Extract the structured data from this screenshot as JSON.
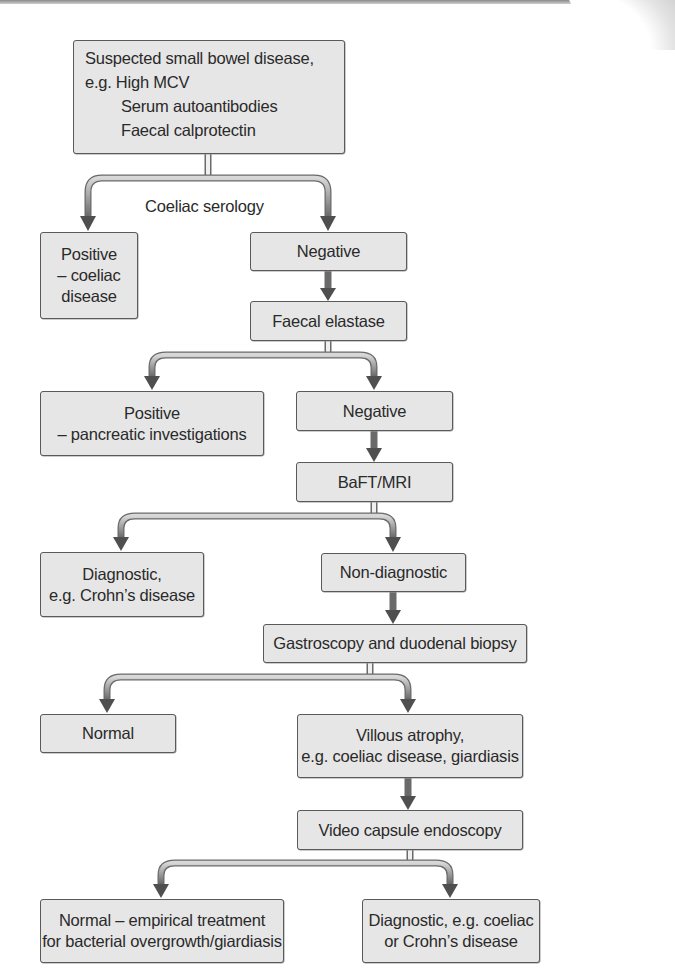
{
  "diagram": {
    "type": "flowchart",
    "colors": {
      "box_fill": "#e6e6e6",
      "box_border": "#5a5a5a",
      "connector": "#8c8c8c",
      "arrowhead": "#555555",
      "text": "#2a2a2a"
    },
    "start": {
      "title": "Suspected small bowel disease,",
      "prefix": "e.g.",
      "examples": [
        "High MCV",
        "Serum autoantibodies",
        "Faecal calprotectin"
      ]
    },
    "edge_labels": {
      "coeliac_serology": "Coeliac serology"
    },
    "nodes": {
      "positive_coeliac": [
        "Positive",
        "– coeliac",
        "disease"
      ],
      "negative_1": [
        "Negative"
      ],
      "faecal_elastase": [
        "Faecal elastase"
      ],
      "positive_pancreatic": [
        "Positive",
        "– pancreatic investigations"
      ],
      "negative_2": [
        "Negative"
      ],
      "baft_mri": [
        "BaFT/MRI"
      ],
      "diagnostic_crohns": [
        "Diagnostic,",
        "e.g. Crohn’s disease"
      ],
      "non_diagnostic": [
        "Non-diagnostic"
      ],
      "gastroscopy": [
        "Gastroscopy and duodenal biopsy"
      ],
      "normal": [
        "Normal"
      ],
      "villous_atrophy": [
        "Villous atrophy,",
        "e.g. coeliac disease, giardiasis"
      ],
      "video_capsule": [
        "Video capsule endoscopy"
      ],
      "normal_empirical": [
        "Normal – empirical treatment",
        "for bacterial overgrowth/giardiasis"
      ],
      "diagnostic_final": [
        "Diagnostic, e.g. coeliac",
        "or Crohn’s disease"
      ]
    },
    "edges": [
      {
        "from": "start",
        "to": "positive_coeliac",
        "label": "Coeliac serology"
      },
      {
        "from": "start",
        "to": "negative_1",
        "label": "Coeliac serology"
      },
      {
        "from": "negative_1",
        "to": "faecal_elastase"
      },
      {
        "from": "faecal_elastase",
        "to": "positive_pancreatic"
      },
      {
        "from": "faecal_elastase",
        "to": "negative_2"
      },
      {
        "from": "negative_2",
        "to": "baft_mri"
      },
      {
        "from": "baft_mri",
        "to": "diagnostic_crohns"
      },
      {
        "from": "baft_mri",
        "to": "non_diagnostic"
      },
      {
        "from": "non_diagnostic",
        "to": "gastroscopy"
      },
      {
        "from": "gastroscopy",
        "to": "normal"
      },
      {
        "from": "gastroscopy",
        "to": "villous_atrophy"
      },
      {
        "from": "villous_atrophy",
        "to": "video_capsule"
      },
      {
        "from": "video_capsule",
        "to": "normal_empirical"
      },
      {
        "from": "video_capsule",
        "to": "diagnostic_final"
      }
    ]
  }
}
